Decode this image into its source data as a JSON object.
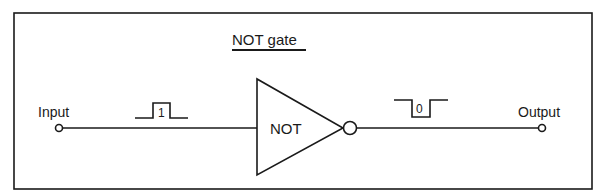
{
  "diagram": {
    "title": "NOT gate",
    "input_label": "Input",
    "output_label": "Output",
    "gate_label": "NOT",
    "input_pulse_value": "1",
    "output_pulse_value": "0"
  },
  "colors": {
    "stroke": "#1a1a1a",
    "background": "#ffffff"
  }
}
